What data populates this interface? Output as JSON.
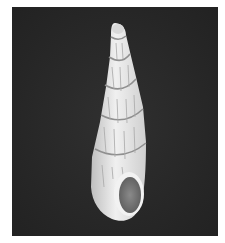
{
  "image": {
    "subject": "shell",
    "background_color": "#262626",
    "shell_color": "#e6e6e6",
    "border_color": "#ffffff"
  }
}
